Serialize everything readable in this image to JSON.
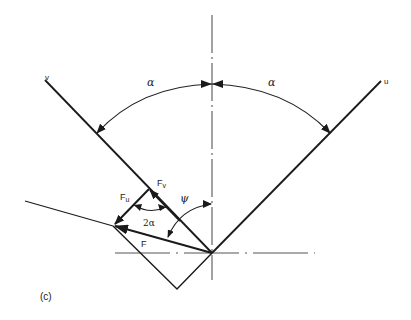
{
  "diagram": {
    "panel_label": "(c)",
    "axes": {
      "u_label": "u",
      "v_label": "v"
    },
    "angles": {
      "alpha_left": "α",
      "alpha_right": "α",
      "two_alpha": "2α",
      "psi": "ψ"
    },
    "forces": {
      "F": "F",
      "Fu_main": "F",
      "Fu_sub": "u",
      "Fv_main": "F",
      "Fv_sub": "v"
    },
    "colors": {
      "line": "#1a1a1a",
      "centerline": "#444444",
      "background": "#ffffff"
    }
  }
}
